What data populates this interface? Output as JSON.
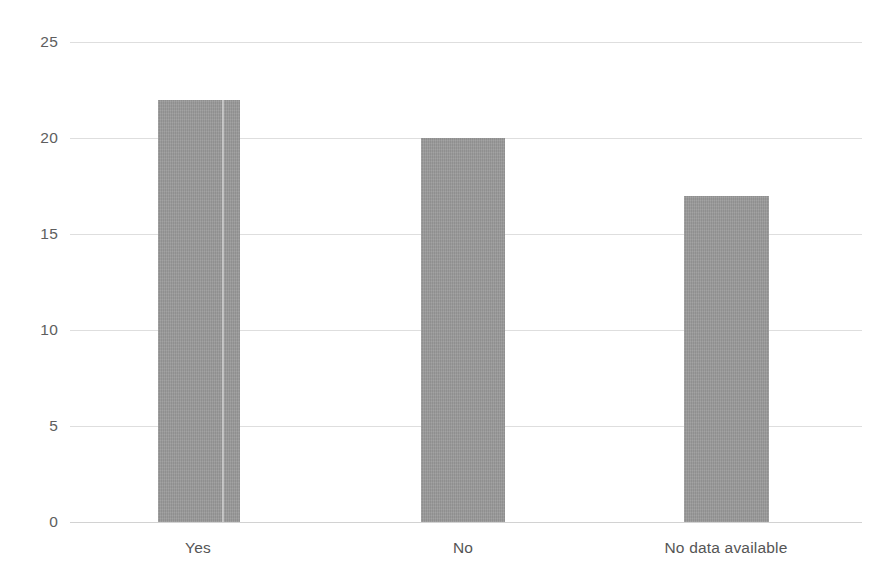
{
  "chart_data": {
    "type": "bar",
    "title": "",
    "subtitle": "",
    "xlabel": "",
    "ylabel": "",
    "categories": [
      "Yes",
      "No",
      "No data available"
    ],
    "values": [
      22,
      20,
      17
    ],
    "series": [
      {
        "name": "Count",
        "values": [
          22,
          20,
          17
        ]
      }
    ],
    "ylim": [
      0,
      25
    ],
    "yticks": [
      "0",
      "5",
      "10",
      "15",
      "20",
      "25"
    ],
    "ytick_values": [
      0,
      5,
      10,
      15,
      20,
      25
    ],
    "grid": "horizontal",
    "legend": "none",
    "bar_color": "#9a9a9a",
    "gridline_color": "#dedede",
    "background_color": "#ffffff",
    "label_color": "#555555"
  }
}
